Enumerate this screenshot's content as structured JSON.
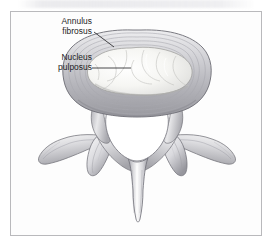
{
  "figure": {
    "background_color": "#ffffff",
    "frame_color": "#b9b9bc",
    "frame_fill": "#fdfdfd",
    "ink_color": "#1d1d1f"
  },
  "labels": {
    "annulus": {
      "line1": "Annulus",
      "line2": "fibrosus",
      "leader": "diagonal-leader-line"
    },
    "nucleus": {
      "line1": "Nucleus",
      "line2": "pulposus",
      "leader": "horizontal-leader-line"
    }
  },
  "anatomy": {
    "disc": "intervertebral-disc",
    "annulus_fibrosus": "annulus-fibrosus-concentric-rings",
    "nucleus_pulposus": "nucleus-pulposus",
    "vertebral_foramen": "vertebral-foramen",
    "pedicle_left": "pedicle-left",
    "pedicle_right": "pedicle-right",
    "transverse_process_left": "transverse-process-left",
    "transverse_process_right": "transverse-process-right",
    "articular_process_left": "superior-articular-process-left",
    "articular_process_right": "superior-articular-process-right",
    "lamina_left": "lamina-left",
    "lamina_right": "lamina-right",
    "spinous_process": "spinous-process"
  },
  "palette": {
    "bone_light": "#fbfbfb",
    "bone_mid": "#d9d9dc",
    "bone_shadow": "#9a9aa0",
    "bone_deep": "#7d7d84",
    "outline": "#6e6e75",
    "nucleus_fill": "#f7f7f5",
    "annulus_ring": "#b4b4b8"
  }
}
